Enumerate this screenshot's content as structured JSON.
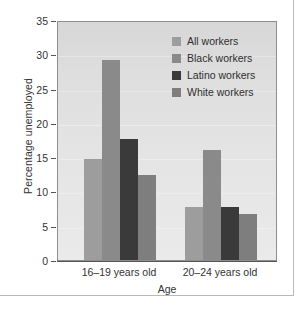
{
  "chart_data": {
    "type": "bar",
    "title": "",
    "xlabel": "Age",
    "ylabel": "Percentage unemployed",
    "categories": [
      "16–19 years old",
      "20–24 years old"
    ],
    "series": [
      {
        "name": "All workers",
        "values": [
          14.7,
          7.8
        ],
        "color": "#9d9d9d"
      },
      {
        "name": "Black workers",
        "values": [
          29.1,
          16.0
        ],
        "color": "#8a8a8a"
      },
      {
        "name": "Latino workers",
        "values": [
          17.6,
          7.7
        ],
        "color": "#3a3a3a"
      },
      {
        "name": "White workers",
        "values": [
          12.4,
          6.7
        ],
        "color": "#7e7e7e"
      }
    ],
    "ylim": [
      0,
      35
    ],
    "yticks": [
      0,
      5,
      10,
      15,
      20,
      25,
      30,
      35
    ],
    "ytick_labels": [
      "0",
      "5",
      "10",
      "15",
      "20",
      "25",
      "30",
      "35"
    ],
    "grid": false,
    "legend_position": "upper-right",
    "plot_background": "#e0e0e0",
    "axis_color": "#555555",
    "frame_color": "#b9b9b9"
  },
  "legend": {
    "items": [
      {
        "label": "All workers"
      },
      {
        "label": "Black workers"
      },
      {
        "label": "Latino workers"
      },
      {
        "label": "White workers"
      }
    ]
  },
  "axes": {
    "y_title": "Percentage unemployed",
    "x_title": "Age",
    "y_tick_labels": [
      "35",
      "30",
      "25",
      "20",
      "15",
      "10",
      "5",
      "0"
    ],
    "x_tick_labels": [
      "16–19 years old",
      "20–24 years old"
    ]
  }
}
